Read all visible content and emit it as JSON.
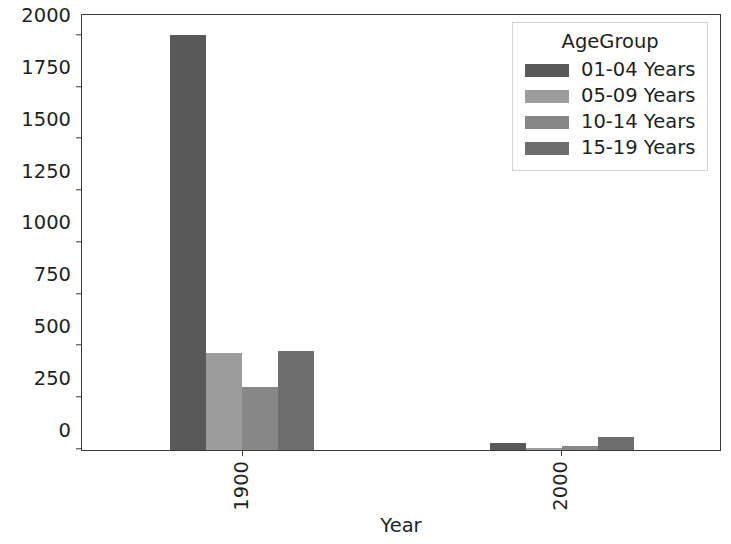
{
  "chart_data": {
    "type": "bar",
    "title": "",
    "xlabel": "Year",
    "ylabel": "",
    "categories": [
      "1900",
      "2000"
    ],
    "series": [
      {
        "name": "01-04 Years",
        "color": "#595959",
        "values": [
          1995,
          33
        ]
      },
      {
        "name": "05-09 Years",
        "color": "#9c9c9c",
        "values": [
          465,
          8
        ]
      },
      {
        "name": "10-14 Years",
        "color": "#878787",
        "values": [
          301,
          18
        ]
      },
      {
        "name": "15-19 Years",
        "color": "#6e6e6e",
        "values": [
          478,
          62
        ]
      }
    ],
    "ylim": [
      0,
      2100
    ],
    "yticks": [
      0,
      250,
      500,
      750,
      1000,
      1250,
      1500,
      1750,
      2000
    ],
    "ytick_labels": [
      "0",
      "250",
      "500",
      "750",
      "1000",
      "1250",
      "1500",
      "1750",
      "2000"
    ],
    "xtick_labels": [
      "1900",
      "2000"
    ],
    "xtick_rotation": 90,
    "grid": false,
    "legend": {
      "title": "AgeGroup",
      "position": "upper right",
      "entries": [
        "01-04 Years",
        "05-09 Years",
        "10-14 Years",
        "15-19 Years"
      ]
    }
  }
}
